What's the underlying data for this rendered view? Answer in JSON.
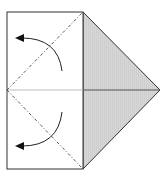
{
  "diagram": {
    "type": "origami-fold-step",
    "colors": {
      "paper_front": "#ffffff",
      "paper_back": "#d6d6d6",
      "outline": "#333333",
      "midline": "#bdbdbd",
      "crease_on_grey": "#555555",
      "fold_line": "#444444",
      "arrow": "#222222"
    },
    "shapes": {
      "square": {
        "x1": 7,
        "y1": 12,
        "x2": 83,
        "y2": 169
      },
      "triangle": {
        "points": [
          [
            83,
            12
          ],
          [
            160,
            90
          ],
          [
            83,
            169
          ]
        ]
      },
      "midline_y": 90
    },
    "fold_lines": [
      {
        "name": "upper-valley-fold",
        "from": [
          7,
          90
        ],
        "to": [
          83,
          12
        ],
        "style": "dash-dot"
      },
      {
        "name": "lower-valley-fold",
        "from": [
          7,
          90
        ],
        "to": [
          83,
          169
        ],
        "style": "dash-dot"
      }
    ],
    "arrows": [
      {
        "name": "upper-fold-arrow",
        "start": [
          62,
          71
        ],
        "control": [
          58,
          38
        ],
        "end": [
          16,
          38
        ]
      },
      {
        "name": "lower-fold-arrow",
        "start": [
          62,
          112
        ],
        "control": [
          58,
          146
        ],
        "end": [
          16,
          146
        ]
      }
    ]
  }
}
